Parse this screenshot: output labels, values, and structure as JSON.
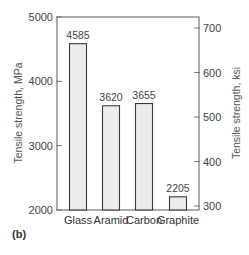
{
  "chart_data": {
    "type": "bar",
    "title": "",
    "panel_label": "(b)",
    "categories": [
      "Glass",
      "Aramid",
      "Carbon",
      "Graphite"
    ],
    "values": [
      4585,
      3620,
      3655,
      2205
    ],
    "value_labels": [
      "4585",
      "3620",
      "3655",
      "2205"
    ],
    "xlabel": "",
    "ylabel": "Tensile strength, MPa",
    "ylabel_right": "Tensile strength, ksi",
    "ylim": [
      2000,
      5000
    ],
    "ylim_right": [
      290,
      725
    ],
    "yticks": [
      2000,
      3000,
      4000,
      5000
    ],
    "yticks_right": [
      300,
      400,
      500,
      600,
      700
    ],
    "grid": false,
    "legend": null
  },
  "colors": {
    "bar_fill": "#ececec",
    "bar_stroke": "#3a3a3a",
    "frame": "#777777"
  }
}
